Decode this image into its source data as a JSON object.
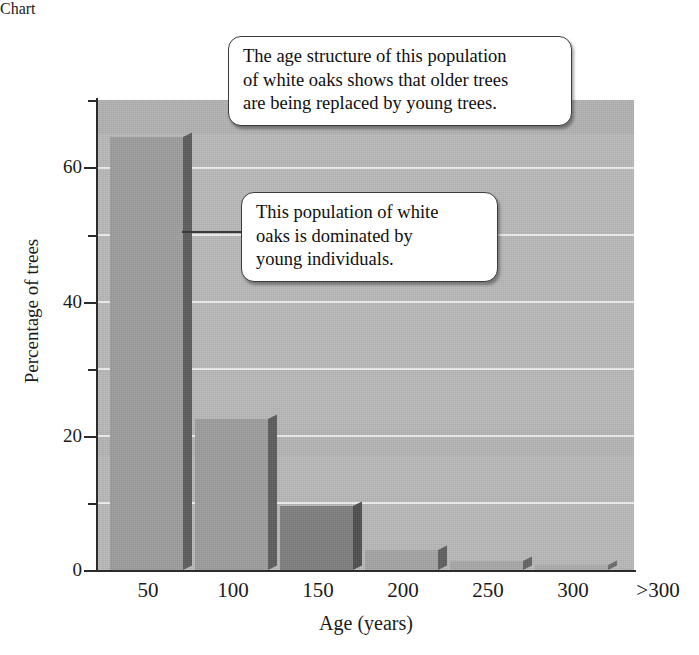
{
  "chart_data": {
    "type": "bar",
    "title": "",
    "xlabel": "Age (years)",
    "ylabel": "Percentage of trees",
    "categories": [
      "50",
      "100",
      "150",
      "200",
      "250",
      "300",
      ">300"
    ],
    "values": [
      64.5,
      22.5,
      9.5,
      3.0,
      1.4,
      0.8,
      0.1
    ],
    "ylim": [
      0,
      70
    ],
    "xlim_note": "categorical bins of tree age in years",
    "y_major_ticks": [
      0,
      20,
      40,
      60
    ],
    "y_major_tick_labels": [
      "0",
      "20",
      "40",
      "60"
    ],
    "y_minor_ticks": [
      10,
      30,
      50,
      70
    ],
    "gridlines": "horizontal white lines every 10 units",
    "grid": true,
    "legend": "none",
    "bar_style": "3d-shaded gray bars on gray background",
    "annotations": [
      {
        "id": "age-structure",
        "text": "The age structure of this population of white oaks shows that older trees are being replaced by young trees.",
        "lines": [
          "The age structure of this population",
          "of white oaks shows that older trees",
          "are being replaced by young trees."
        ]
      },
      {
        "id": "young-dominance",
        "text": "This population of white oaks is dominated by young individuals.",
        "lines": [
          "This population of white",
          "oaks is dominated by",
          "young individuals."
        ],
        "pointer": "leader line pointing left toward the tall 50-year bar"
      }
    ]
  },
  "colors": {
    "plot_background": "#b9b9b9",
    "bar_face": "#9d9d9d",
    "bar_side_shadow": "#5c5c5c",
    "gridline": "#f2f2f2",
    "axis": "#2b2b2b",
    "callout_background": "#ffffff",
    "callout_border": "#3d3d3d",
    "text": "#1a1a1a",
    "page_background": "#ffffff"
  },
  "axes": {
    "y_title": "Percentage of trees",
    "x_title": "Age (years)",
    "y_ticks": [
      {
        "value": "60",
        "label": "60"
      },
      {
        "value": "40",
        "label": "40"
      },
      {
        "value": "20",
        "label": "20"
      },
      {
        "value": "0",
        "label": "0"
      }
    ],
    "x_ticks": [
      {
        "label": "50"
      },
      {
        "label": "100"
      },
      {
        "label": "150"
      },
      {
        "label": "200"
      },
      {
        "label": "250"
      },
      {
        "label": "300"
      },
      {
        "label": ">300"
      }
    ]
  }
}
